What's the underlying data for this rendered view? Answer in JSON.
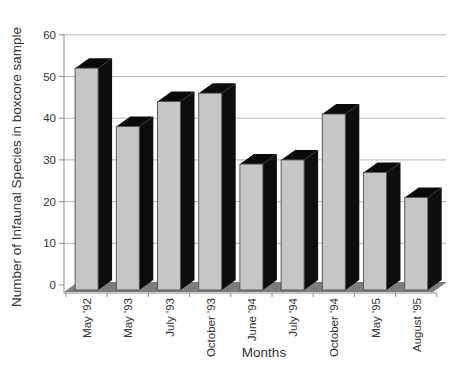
{
  "figure": {
    "background": "#ffffff"
  },
  "chart_data": {
    "type": "bar",
    "style": "3d-oblique-columns",
    "title": "",
    "xlabel": "Months",
    "ylabel": "Number of Infaunal Species in boxcore sample",
    "categories": [
      "May '92",
      "May '93",
      "July '93",
      "October '93",
      "June '94",
      "July '94",
      "October '94",
      "May '95",
      "August '95"
    ],
    "values": [
      52,
      38,
      44,
      46,
      29,
      30,
      41,
      27,
      21
    ],
    "ylim": [
      0,
      60
    ],
    "yticks": [
      0,
      10,
      20,
      30,
      40,
      50,
      60
    ],
    "ytick_labels": [
      "0",
      "10",
      "20",
      "30",
      "40",
      "50",
      "60"
    ],
    "grid": true,
    "legend": false,
    "x_tick_label_rotation_deg": 90,
    "colors": {
      "bar_face": "#c6c6c6",
      "bar_face_outline": "#4d4d4d",
      "bar_side": "#0d0d0d",
      "bar_top": "#0a0a0a",
      "floor": "#7d7d7d",
      "gridline": "#b9b9b9",
      "axis_line": "#8f8f8f",
      "tick": "#8f8f8f",
      "text": "#333333"
    }
  }
}
